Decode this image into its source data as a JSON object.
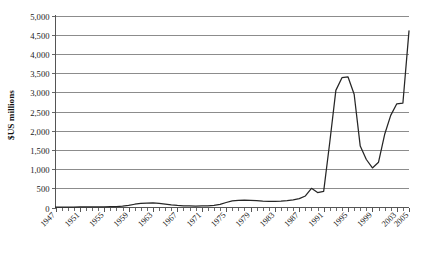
{
  "chart_data": {
    "type": "line",
    "title": "",
    "xlabel": "",
    "ylabel": "$US millions",
    "ylim": [
      0,
      5000
    ],
    "xlim": [
      1947,
      2005
    ],
    "grid": true,
    "legend": "none",
    "ytick_labels": [
      "5,000",
      "4,500",
      "4,000",
      "3,500",
      "3,000",
      "2,500",
      "2,000",
      "1,500",
      "1,000",
      "500",
      "0"
    ],
    "ytick_values": [
      5000,
      4500,
      4000,
      3500,
      3000,
      2500,
      2000,
      1500,
      1000,
      500,
      0
    ],
    "xtick_labels": [
      "1947",
      "1951",
      "1955",
      "1959",
      "1963",
      "1967",
      "1971",
      "1975",
      "1979",
      "1983",
      "1987",
      "1991",
      "1995",
      "1999",
      "2003",
      "2005"
    ],
    "xtick_values": [
      1947,
      1951,
      1955,
      1959,
      1963,
      1967,
      1971,
      1975,
      1979,
      1983,
      1987,
      1991,
      1995,
      1999,
      2003,
      2005
    ],
    "x": [
      1947,
      1948,
      1949,
      1950,
      1951,
      1952,
      1953,
      1954,
      1955,
      1956,
      1957,
      1958,
      1959,
      1960,
      1961,
      1962,
      1963,
      1964,
      1965,
      1966,
      1967,
      1968,
      1969,
      1970,
      1971,
      1972,
      1973,
      1974,
      1975,
      1976,
      1977,
      1978,
      1979,
      1980,
      1981,
      1982,
      1983,
      1984,
      1985,
      1986,
      1987,
      1988,
      1989,
      1990,
      1991,
      1992,
      1993,
      1994,
      1995,
      1996,
      1997,
      1998,
      1999,
      2000,
      2001,
      2002,
      2003,
      2004,
      2005
    ],
    "values": [
      10,
      10,
      12,
      12,
      14,
      14,
      15,
      16,
      18,
      20,
      25,
      35,
      55,
      85,
      105,
      115,
      118,
      110,
      90,
      70,
      55,
      45,
      40,
      38,
      40,
      45,
      55,
      80,
      130,
      170,
      185,
      190,
      188,
      180,
      165,
      160,
      160,
      165,
      180,
      200,
      230,
      300,
      500,
      390,
      420,
      1700,
      3050,
      3380,
      3400,
      2950,
      1600,
      1250,
      1030,
      1180,
      1900,
      2400,
      2700,
      2720,
      4600
    ],
    "series": [
      {
        "name": "series-1",
        "color": "#262626"
      }
    ],
    "axis_color": "#555555",
    "grid_color": "#808080",
    "background": "#ffffff"
  }
}
